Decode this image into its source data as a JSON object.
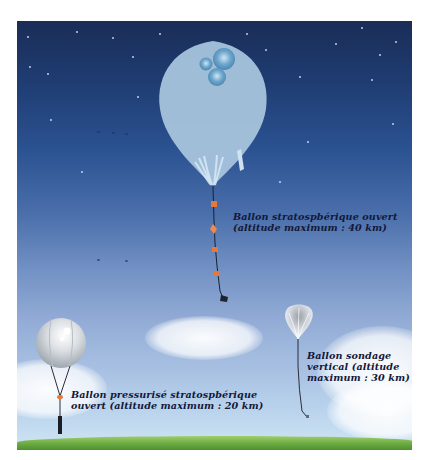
{
  "figure": {
    "type": "illustration",
    "colors": {
      "sky_top": "#1a2d57",
      "sky_bottom": "#cfe5f3",
      "ground": "#6fae45",
      "balloon_large": "#a7c4dc",
      "payload_orange": "#e8783a",
      "text": "#13183a"
    }
  },
  "balloons": [
    {
      "id": "stratospheric-open",
      "label_lines": [
        "Ballon stratospbérique ouvert",
        "(altitude maximum : 40 km)"
      ],
      "max_altitude_km": 40
    },
    {
      "id": "vertical-sounding",
      "label_lines": [
        "Ballon sondage",
        "vertical (altitude",
        "maximum : 30 km)"
      ],
      "max_altitude_km": 30
    },
    {
      "id": "pressurized-stratospheric",
      "label_lines": [
        "Ballon pressurisé stratospbérique",
        "ouvert (altitude maximum : 20 km)"
      ],
      "max_altitude_km": 20
    }
  ]
}
